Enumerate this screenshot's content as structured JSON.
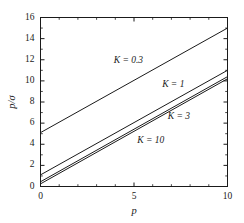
{
  "chart_data": {
    "type": "line",
    "title": "",
    "subtitle": "",
    "xlabel": "p",
    "ylabel": "p/σ",
    "xlim": [
      0,
      10
    ],
    "ylim": [
      0,
      16
    ],
    "xticks": [
      0,
      5,
      10
    ],
    "xtick_labels": [
      "0",
      "5",
      "10"
    ],
    "yticks": [
      0,
      2,
      4,
      6,
      8,
      10,
      12,
      14,
      16
    ],
    "ytick_labels": [
      "0",
      "2",
      "4",
      "6",
      "8",
      "10",
      "12",
      "14",
      "16"
    ],
    "x_minor_ticks": [
      1,
      2,
      3,
      4,
      6,
      7,
      8,
      9
    ],
    "y_minor_ticks": [
      1,
      3,
      5,
      7,
      9,
      11,
      13,
      15
    ],
    "grid": false,
    "legend": "inline-annotations",
    "line_color": "#1a1a1a",
    "frame_color": "#1a1a1a",
    "background": "#ffffff",
    "x": [
      0,
      10
    ],
    "series": [
      {
        "name": "K = 0.3",
        "label": "K = 0.3",
        "values": [
          5.1,
          15.0
        ],
        "label_x": 4.7,
        "label_y": 11.9
      },
      {
        "name": "K = 1",
        "label": "K = 1",
        "values": [
          1.1,
          11.0
        ],
        "label_x": 7.1,
        "label_y": 9.6
      },
      {
        "name": "K = 3",
        "label": "K = 3",
        "values": [
          0.45,
          10.4
        ],
        "label_x": 7.4,
        "label_y": 6.6
      },
      {
        "name": "K = 10",
        "label": "K = 10",
        "values": [
          0.25,
          10.2
        ],
        "label_x": 5.9,
        "label_y": 4.3
      }
    ]
  }
}
